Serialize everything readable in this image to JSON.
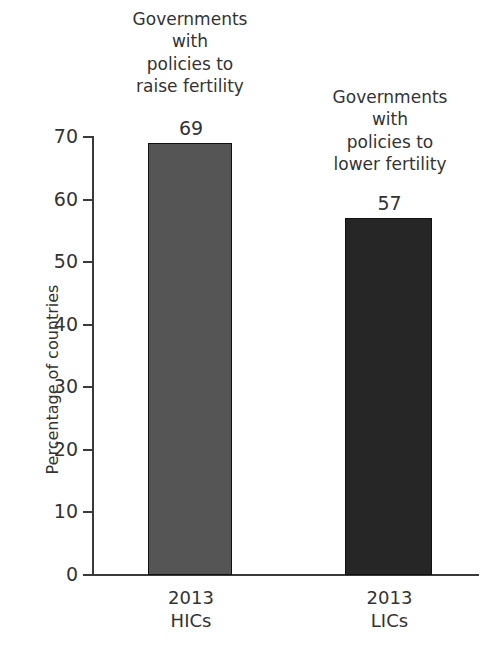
{
  "chart_data": {
    "type": "bar",
    "title": "",
    "xlabel": "",
    "ylabel": "Percentage of countries",
    "ylim": [
      0,
      70
    ],
    "yticks": [
      0,
      10,
      20,
      30,
      40,
      50,
      60,
      70
    ],
    "ytick_labels": [
      "0",
      "10",
      "20",
      "30",
      "40",
      "50",
      "60",
      "70"
    ],
    "grid": false,
    "legend": "none",
    "categories": [
      "2013 HICs",
      "2013 LICs"
    ],
    "values": [
      69,
      57
    ],
    "bars": [
      {
        "category_line1": "2013",
        "category_line2": "HICs",
        "value": 69,
        "value_label": "69",
        "color": "#555555",
        "annotation": "Governments with policies to raise fertility"
      },
      {
        "category_line1": "2013",
        "category_line2": "LICs",
        "value": 57,
        "value_label": "57",
        "color": "#262626",
        "annotation": "Governments with policies to lower fertility"
      }
    ]
  },
  "annotations": {
    "bar1": {
      "line1": "Governments",
      "line2": "with",
      "line3": "policies to",
      "line4": "raise fertility"
    },
    "bar2": {
      "line1": "Governments",
      "line2": "with",
      "line3": "policies to",
      "line4": "lower fertility"
    }
  },
  "colors": {
    "background": "#ffffff",
    "axis": "#3a3a3a",
    "text": "#333333",
    "bar_hic": "#555555",
    "bar_lic": "#262626"
  }
}
